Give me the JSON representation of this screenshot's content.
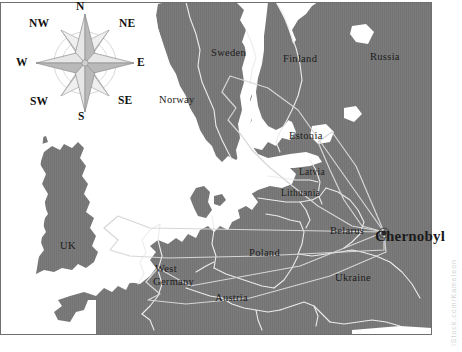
{
  "figure": {
    "kind": "map",
    "background_color": "#ffffff",
    "land_color": "#7b7b7b",
    "sea_color": "#ffffff",
    "border_color": "#e8e8e8",
    "plume_color": "#cfcfcf",
    "label_color": "#1b1b1b"
  },
  "compass": {
    "name": "compass-rose",
    "directions": {
      "n": "N",
      "ne": "NE",
      "e": "E",
      "se": "SE",
      "s": "S",
      "sw": "SW",
      "w": "W",
      "nw": "NW"
    }
  },
  "labels": {
    "countries": [
      {
        "id": "norway",
        "text": "Norway"
      },
      {
        "id": "sweden",
        "text": "Sweden"
      },
      {
        "id": "finland",
        "text": "Finland"
      },
      {
        "id": "russia",
        "text": "Russia"
      },
      {
        "id": "estonia",
        "text": "Estonia"
      },
      {
        "id": "latvia",
        "text": "Latvia"
      },
      {
        "id": "lithuania",
        "text": "Lithuania"
      },
      {
        "id": "belarus",
        "text": "Belarus"
      },
      {
        "id": "poland",
        "text": "Poland"
      },
      {
        "id": "ukraine",
        "text": "Ukraine"
      },
      {
        "id": "uk",
        "text": "UK"
      },
      {
        "id": "west-germany",
        "text": "West\nGermany"
      },
      {
        "id": "west",
        "text": "West"
      },
      {
        "id": "germany",
        "text": "Germany"
      },
      {
        "id": "austria",
        "text": "Austria"
      }
    ],
    "cities": [
      {
        "id": "chernobyl",
        "text": "Chernobyl"
      }
    ]
  },
  "watermark": {
    "text": "iStock.com/Kameleon"
  }
}
